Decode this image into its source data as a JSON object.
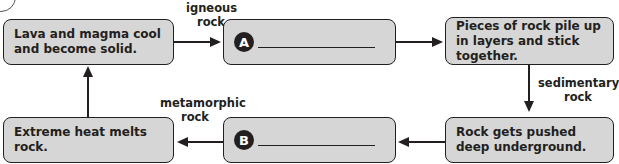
{
  "diagram": {
    "type": "rock cycle flowchart",
    "boxes": {
      "lava": "Lava and magma cool and become solid.",
      "a": {
        "badge": "A",
        "blank": ""
      },
      "pieces": "Pieces of rock pile up in layers and stick together.",
      "pushed": "Rock gets pushed deep underground.",
      "b": {
        "badge": "B",
        "blank": ""
      },
      "heat": "Extreme heat melts rock."
    },
    "arrow_labels": {
      "igneous": "igneous rock",
      "sedimentary": "sedimentary rock",
      "metamorphic": "metamorphic rock"
    },
    "colors": {
      "box_fill": "#d6d6d6",
      "stroke": "#231f20"
    }
  }
}
